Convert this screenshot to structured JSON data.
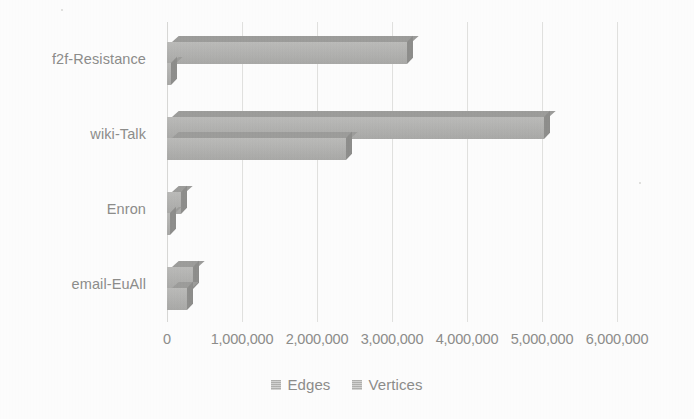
{
  "chart_data": {
    "type": "bar",
    "orientation": "horizontal",
    "title": "",
    "subtitle": "",
    "xlabel": "",
    "ylabel": "",
    "categories": [
      "f2f-Resistance",
      "wiki-Talk",
      "Enron",
      "email-EuAll"
    ],
    "series": [
      {
        "name": "Edges",
        "values": [
          3200000,
          5020000,
          180000,
          340000
        ],
        "color": "#b4b4b2"
      },
      {
        "name": "Vertices",
        "values": [
          50000,
          2390000,
          37000,
          270000
        ],
        "color": "#b4b4b2"
      }
    ],
    "xlim": [
      0,
      6000000
    ],
    "xticks": [
      0,
      1000000,
      2000000,
      3000000,
      4000000,
      5000000,
      6000000
    ],
    "xtick_labels": [
      "0",
      "1,000,000",
      "2,000,000",
      "3,000,000",
      "4,000,000",
      "5,000,000",
      "6,000,000"
    ],
    "grid": true,
    "grid_axis": "x",
    "legend_position": "bottom",
    "style_3d": true
  },
  "axis": {
    "tick_labels": [
      "0",
      "1,000,000",
      "2,000,000",
      "3,000,000",
      "4,000,000",
      "5,000,000",
      "6,000,000"
    ]
  },
  "categories": {
    "labels": [
      "f2f-Resistance",
      "wiki-Talk",
      "Enron",
      "email-EuAll"
    ]
  },
  "legend": {
    "items": [
      {
        "label": "Edges",
        "swatch": "legend-swatch-edges"
      },
      {
        "label": "Vertices",
        "swatch": "legend-swatch-vertices"
      }
    ]
  },
  "colors": {
    "bar_front": "#b4b4b2",
    "bar_top": "#9d9d9b",
    "bar_side": "#8e8e8c",
    "gridline": "#e2e2e0",
    "text": "#8d8d8b",
    "background": "#fefefe"
  }
}
